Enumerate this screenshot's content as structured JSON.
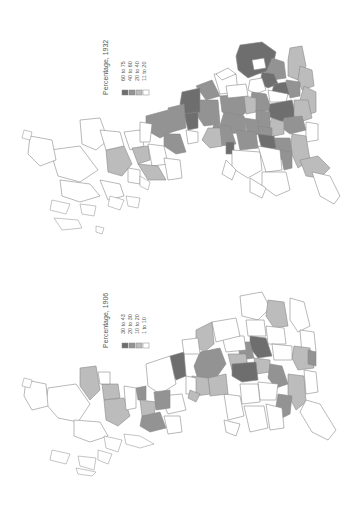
{
  "maps": [
    {
      "id": "1932",
      "legend": {
        "title": "Percentage, 1932",
        "classes": [
          {
            "label": "60 to 75",
            "color": "#6e6e6e"
          },
          {
            "label": "40 to 60",
            "color": "#939393"
          },
          {
            "label": "20 to 40",
            "color": "#bcbcbc"
          },
          {
            "label": "11 to 20",
            "color": "#ffffff"
          }
        ]
      }
    },
    {
      "id": "1906",
      "legend": {
        "title": "Percentage, 1906",
        "classes": [
          {
            "label": "30 to 43",
            "color": "#6e6e6e"
          },
          {
            "label": "20 to 30",
            "color": "#939393"
          },
          {
            "label": "10 to 20",
            "color": "#bcbcbc"
          },
          {
            "label": "1 to 10",
            "color": "#ffffff"
          }
        ]
      }
    }
  ],
  "colors": {
    "border": "#8a8a8a",
    "background": "#ffffff"
  }
}
